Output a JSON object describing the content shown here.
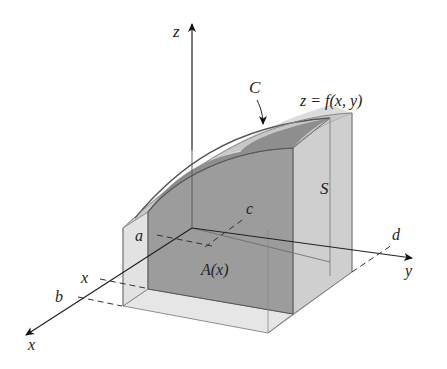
{
  "figure": {
    "type": "3d-solid-cross-section",
    "labels": {
      "z_axis": "z",
      "x_axis": "x",
      "y_axis": "y",
      "surface_eq": "z = f(x, y)",
      "curve": "C",
      "surface": "S",
      "a": "a",
      "b": "b",
      "c": "c",
      "d": "d",
      "x_tick": "x",
      "area": "A(x)"
    },
    "colors": {
      "outer_solid": "#d9d9d9",
      "cross_section": "#9a9a9a",
      "cap": "#b8b8b8",
      "axis": "#222222",
      "edge": "#555555"
    }
  }
}
